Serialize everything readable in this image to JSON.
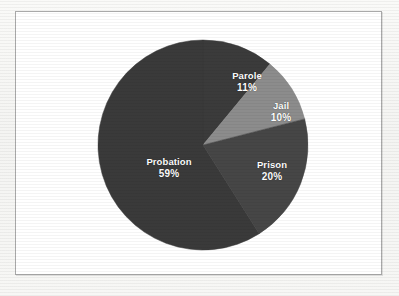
{
  "figure": {
    "background_color": "#f6f6f4",
    "frame_color": "#a9a9a9",
    "plot_background": "#ffffff"
  },
  "chart_data": {
    "type": "pie",
    "title": "",
    "subtitle": "",
    "xlabel": "",
    "ylabel": "",
    "grid": false,
    "legend": "none",
    "label_format": "name above percent, inside slice, white bold text",
    "start_angle_deg": 0,
    "direction": "clockwise",
    "center_px": [
      203,
      145
    ],
    "radius_px": 105,
    "categories": [
      "Parole",
      "Jail",
      "Prison",
      "Probation"
    ],
    "values": [
      11,
      10,
      20,
      59
    ],
    "units": "percent",
    "slices": [
      {
        "name": "Parole",
        "value": 11,
        "value_label": "11%",
        "color": "#3b3b3b",
        "start_angle_deg": 0,
        "end_angle_deg": 39.6
      },
      {
        "name": "Jail",
        "value": 10,
        "value_label": "10%",
        "color": "#8c8c8c",
        "start_angle_deg": 39.6,
        "end_angle_deg": 75.6
      },
      {
        "name": "Prison",
        "value": 20,
        "value_label": "20%",
        "color": "#464646",
        "start_angle_deg": 75.6,
        "end_angle_deg": 147.6
      },
      {
        "name": "Probation",
        "value": 59,
        "value_label": "59%",
        "color": "#3a3a3a",
        "start_angle_deg": 147.6,
        "end_angle_deg": 360
      }
    ],
    "total": 100
  },
  "labels": {
    "parole": {
      "name": "Parole",
      "value": "11%"
    },
    "jail": {
      "name": "Jail",
      "value": "10%"
    },
    "prison": {
      "name": "Prison",
      "value": "20%"
    },
    "probation": {
      "name": "Probation",
      "value": "59%"
    }
  }
}
